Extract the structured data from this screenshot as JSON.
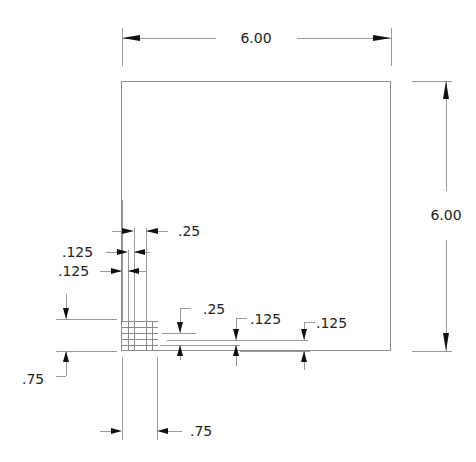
{
  "drawing": {
    "overall_width": "6.00",
    "overall_height": "6.00",
    "notch_gap_top": ".25",
    "notch_x_1": ".125",
    "notch_x_2": ".125",
    "notch_gap_right": ".25",
    "notch_y_1": ".125",
    "notch_y_2": ".125",
    "offset_left": ".75",
    "offset_bottom": ".75"
  },
  "colors": {
    "line": "#8a8a8a",
    "arrow": "#111111",
    "text": "#222222",
    "background": "#ffffff"
  }
}
